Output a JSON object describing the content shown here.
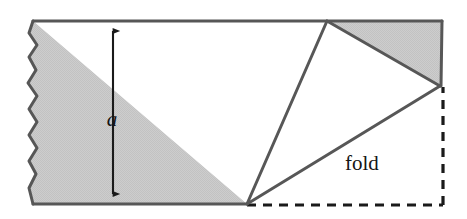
{
  "figure": {
    "canvas": {
      "width": 467,
      "height": 219,
      "background": "#ffffff"
    },
    "colors": {
      "paper_fill": "#c9c9c9",
      "flap_fill": "#ffffff",
      "outline": "#575757",
      "dashed": "#1a1a1a",
      "arrow": "#1a1a1a",
      "text": "#151515"
    },
    "labels": [
      {
        "name": "width-label-a",
        "text": "a",
        "style": "italic",
        "x": 112,
        "y": 126,
        "meaning": "width of the paper strip"
      },
      {
        "name": "fold-label",
        "text": "fold",
        "style": "roman",
        "x": 345,
        "y": 170,
        "meaning": "the crease line along which the corner is folded"
      }
    ],
    "geometry": {
      "strip": {
        "top_y": 21,
        "bottom_y": 204,
        "right_x": 442,
        "left_torn_edge_x": 33
      },
      "torn_edge_points": "33,21 29,33 37,45 29,57 36,70 28,83 37,96 29,109 37,122 29,135 37,148 29,161 36,174 29,188 33,204",
      "fold_triangle": {
        "name": "white-fold-flap",
        "vertices": [
          [
            327,
            21
          ],
          [
            440,
            86
          ],
          [
            247,
            204
          ]
        ]
      },
      "shaded_corner_triangle": {
        "name": "shaded-upper-right-triangle",
        "vertices": [
          [
            327,
            21
          ],
          [
            442,
            21
          ],
          [
            440,
            86
          ]
        ]
      },
      "crease_line": {
        "name": "fold-crease",
        "from": [
          247,
          204
        ],
        "to": [
          440,
          86
        ]
      },
      "dashed_outline": {
        "name": "original-corner-outline",
        "horizontal": {
          "from": [
            247,
            205
          ],
          "to": [
            443,
            205
          ]
        },
        "vertical": {
          "from": [
            443,
            205
          ],
          "to": [
            443,
            87
          ]
        }
      },
      "dimension_arrow": {
        "name": "width-dimension-arrow",
        "x": 113,
        "top_y": 23,
        "bottom_y": 202,
        "double_headed": true
      }
    }
  }
}
